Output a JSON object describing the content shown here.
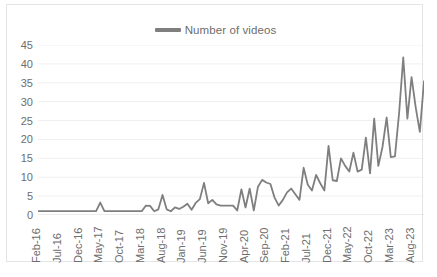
{
  "chart_data": {
    "type": "line",
    "title": "",
    "xlabel": "",
    "ylabel": "",
    "ylim": [
      0,
      45
    ],
    "ytick_step": 5,
    "yticks": [
      45,
      40,
      35,
      30,
      25,
      20,
      15,
      10,
      5,
      0
    ],
    "grid": true,
    "legend_position": "top-center",
    "legend": [
      "Number of videos"
    ],
    "line_color": "#7f7f7f",
    "tick_label_color": "#6d6d6d",
    "plot_background": "#ffffff",
    "border_color": "#e4e4e4",
    "xtick_interval_months": 5,
    "xticks": [
      "Feb-16",
      "Jul-16",
      "Dec-16",
      "May-17",
      "Oct-17",
      "Mar-18",
      "Aug-18",
      "Jan-19",
      "Jun-19",
      "Nov-19",
      "Apr-20",
      "Sep-20",
      "Feb-21",
      "Jul-21",
      "Dec-21",
      "May-22",
      "Oct-22",
      "Mar-23",
      "Aug-23"
    ],
    "categories": [
      "Feb-16",
      "Mar-16",
      "Apr-16",
      "May-16",
      "Jun-16",
      "Jul-16",
      "Aug-16",
      "Sep-16",
      "Oct-16",
      "Nov-16",
      "Dec-16",
      "Jan-17",
      "Feb-17",
      "Mar-17",
      "Apr-17",
      "May-17",
      "Jun-17",
      "Jul-17",
      "Aug-17",
      "Sep-17",
      "Oct-17",
      "Nov-17",
      "Dec-17",
      "Jan-18",
      "Feb-18",
      "Mar-18",
      "Apr-18",
      "May-18",
      "Jun-18",
      "Jul-18",
      "Aug-18",
      "Sep-18",
      "Oct-18",
      "Nov-18",
      "Dec-18",
      "Jan-19",
      "Feb-19",
      "Mar-19",
      "Apr-19",
      "May-19",
      "Jun-19",
      "Jul-19",
      "Aug-19",
      "Sep-19",
      "Oct-19",
      "Nov-19",
      "Dec-19",
      "Jan-20",
      "Feb-20",
      "Mar-20",
      "Apr-20",
      "May-20",
      "Jun-20",
      "Jul-20",
      "Aug-20",
      "Sep-20",
      "Oct-20",
      "Nov-20",
      "Dec-20",
      "Jan-21",
      "Feb-21",
      "Mar-21",
      "Apr-21",
      "May-21",
      "Jun-21",
      "Jul-21",
      "Aug-21",
      "Sep-21",
      "Oct-21",
      "Nov-21",
      "Dec-21",
      "Jan-22",
      "Feb-22",
      "Mar-22",
      "Apr-22",
      "May-22",
      "Jun-22",
      "Jul-22",
      "Aug-22",
      "Sep-22",
      "Oct-22",
      "Nov-22",
      "Dec-22",
      "Jan-23",
      "Feb-23",
      "Mar-23",
      "Apr-23",
      "May-23",
      "Jun-23",
      "Jul-23",
      "Aug-23",
      "Sep-23",
      "Oct-23",
      "Nov-23"
    ],
    "series": [
      {
        "name": "Number of videos",
        "values": [
          1,
          1,
          1,
          1,
          1,
          1,
          1,
          1,
          1,
          1,
          1,
          1,
          1,
          1,
          1,
          3.3,
          1,
          1,
          1,
          1,
          1,
          1,
          1,
          1,
          1,
          1,
          2.5,
          2.4,
          1,
          1.5,
          5.3,
          1.5,
          1,
          2,
          1.6,
          2.2,
          3,
          1.4,
          3.2,
          4.2,
          8.5,
          3.1,
          4,
          2.8,
          2.5,
          2.5,
          2.5,
          2.5,
          1.2,
          6.8,
          2,
          7,
          1.2,
          7.5,
          9.3,
          8.6,
          8.2,
          4.6,
          2.5,
          4,
          6,
          7,
          5.5,
          4,
          12.5,
          8,
          6.5,
          10.6,
          8.4,
          6.5,
          18.3,
          9.2,
          9,
          15,
          13,
          11.5,
          16.5,
          11.5,
          12,
          20.5,
          11,
          25.5,
          13,
          18,
          25.8,
          15.3,
          15.5,
          27,
          41.7,
          25.5,
          36.5,
          28.5,
          22,
          35.4
        ]
      }
    ]
  }
}
